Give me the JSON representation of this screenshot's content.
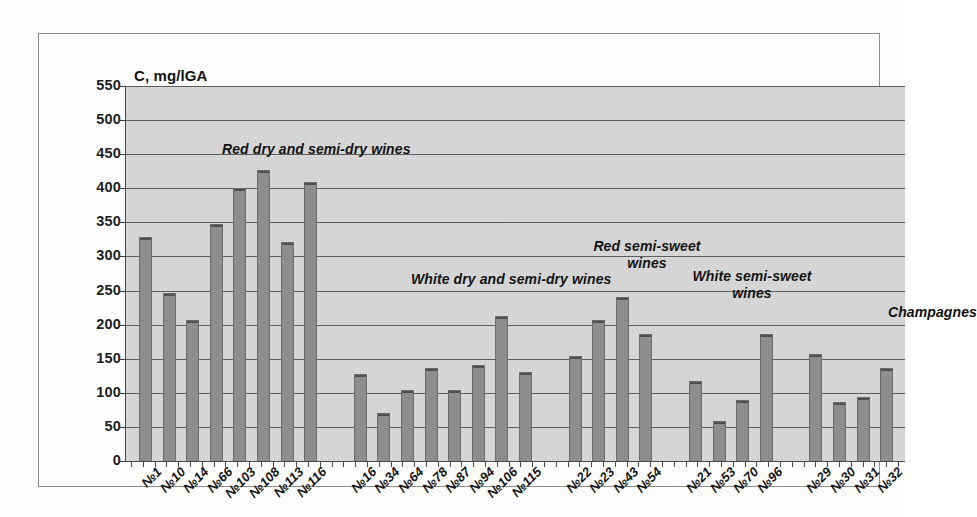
{
  "chart_data": {
    "type": "bar",
    "title": "C, mg/lGA",
    "xlabel": "",
    "ylabel": "C, mg/lGA",
    "ylim": [
      0,
      550
    ],
    "ytick_step": 50,
    "grid": true,
    "legend": "none",
    "bar_color": "#8e8e8e",
    "plot_background": "#d8d8d8",
    "yticks": [
      "550",
      "500",
      "450",
      "400",
      "350",
      "300",
      "250",
      "200",
      "150",
      "100",
      "50",
      "0"
    ],
    "categories": [
      "№1",
      "№10",
      "№14",
      "№66",
      "№103",
      "№108",
      "№113",
      "№116",
      "№16",
      "№34",
      "№64",
      "№78",
      "№87",
      "№94",
      "№106",
      "№115",
      "№22",
      "№23",
      "№43",
      "№54",
      "№21",
      "№53",
      "№70",
      "№96",
      "№29",
      "№30",
      "№31",
      "№32"
    ],
    "values": [
      328,
      246,
      207,
      347,
      400,
      427,
      321,
      409,
      128,
      71,
      104,
      137,
      104,
      141,
      212,
      131,
      154,
      207,
      240,
      187,
      117,
      59,
      90,
      187,
      157,
      86,
      94,
      136
    ],
    "groups": [
      {
        "label": "Red dry and semi-dry wines",
        "label_lines": [
          "Red dry and semi-dry wines"
        ],
        "start_index": 0,
        "count": 8
      },
      {
        "label": "White dry and semi-dry wines",
        "label_lines": [
          "White dry and semi-dry wines"
        ],
        "start_index": 8,
        "count": 8
      },
      {
        "label": "Red semi-sweet wines",
        "label_lines": [
          "Red semi-sweet",
          "wines"
        ],
        "start_index": 16,
        "count": 4
      },
      {
        "label": "White semi-sweet wines",
        "label_lines": [
          "White semi-sweet",
          "wines"
        ],
        "start_index": 20,
        "count": 4
      },
      {
        "label": "Champagnes",
        "label_lines": [
          "Champagnes"
        ],
        "start_index": 24,
        "count": 4
      }
    ],
    "annotations": [
      {
        "text": "Red dry and semi-dry wines",
        "x_px": 96,
        "y_px": 55,
        "align": "left"
      },
      {
        "text": "White dry and semi-dry wines",
        "x_px": 285,
        "y_px": 185,
        "align": "left"
      },
      {
        "text": "Red semi-sweet\nwines",
        "x_px": 521,
        "y_px": 152,
        "align": "center"
      },
      {
        "text": "White semi-sweet\nwines",
        "x_px": 626,
        "y_px": 182,
        "align": "center"
      },
      {
        "text": "Champagnes",
        "x_px": 762,
        "y_px": 218,
        "align": "left"
      }
    ]
  }
}
